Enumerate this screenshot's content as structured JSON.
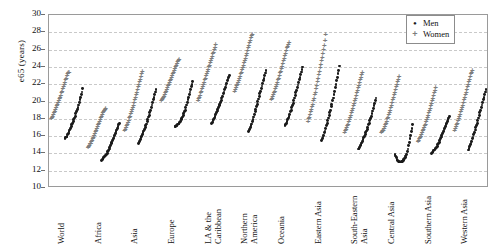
{
  "chart_data": {
    "type": "scatter",
    "title": "",
    "xlabel": "",
    "ylabel": "e65 (years)",
    "ylim": [
      10,
      30
    ],
    "yticks": [
      10,
      12,
      14,
      16,
      18,
      20,
      22,
      24,
      26,
      28,
      30
    ],
    "grid": true,
    "legend_position": "top-right",
    "colors": {
      "men": "#1a1a1a",
      "women": "#7d7d7d"
    },
    "categories": [
      "World",
      "Africa",
      "Asia",
      "Europe",
      "LA & the\nCaribbean",
      "Northern\nAmerica",
      "Oceania",
      "Eastern Asia",
      "South-Eastern\nAsia",
      "Central Asia",
      "Southern Asia",
      "Western Asia"
    ],
    "series": [
      {
        "name": "Men",
        "marker": "dot"
      },
      {
        "name": "Women",
        "marker": "plus"
      }
    ],
    "clusters": [
      {
        "category": "World",
        "men": [
          15.7,
          15.8,
          15.9,
          16.0,
          16.2,
          16.3,
          16.5,
          16.7,
          16.9,
          17.1,
          17.3,
          17.5,
          17.7,
          17.9,
          18.1,
          18.3,
          18.6,
          18.8,
          19.1,
          19.3,
          19.6,
          19.9,
          20.2,
          20.5,
          20.8,
          21.1,
          21.5
        ],
        "women": [
          17.8,
          17.9,
          18.1,
          18.3,
          18.5,
          18.7,
          18.9,
          19.1,
          19.3,
          19.5,
          19.7,
          19.9,
          20.1,
          20.3,
          20.5,
          20.8,
          21.0,
          21.3,
          21.5,
          21.8,
          22.0,
          22.3,
          22.5,
          22.8,
          23.0,
          23.1,
          23.2
        ]
      },
      {
        "category": "Africa",
        "men": [
          13.2,
          13.3,
          13.4,
          13.5,
          13.6,
          13.7,
          13.8,
          13.9,
          14.0,
          14.2,
          14.3,
          14.5,
          14.7,
          14.9,
          15.1,
          15.3,
          15.5,
          15.7,
          15.9,
          16.1,
          16.3,
          16.5,
          16.7,
          16.9,
          17.1,
          17.3,
          17.5
        ],
        "women": [
          14.5,
          14.6,
          14.7,
          14.9,
          15.0,
          15.2,
          15.3,
          15.5,
          15.7,
          15.9,
          16.1,
          16.3,
          16.5,
          16.7,
          16.9,
          17.1,
          17.3,
          17.5,
          17.7,
          17.9,
          18.1,
          18.3,
          18.5,
          18.7,
          18.8,
          18.9,
          19.0
        ]
      },
      {
        "category": "Asia",
        "men": [
          15.1,
          15.2,
          15.4,
          15.6,
          15.8,
          16.0,
          16.2,
          16.4,
          16.6,
          16.8,
          17.0,
          17.2,
          17.4,
          17.7,
          17.9,
          18.2,
          18.4,
          18.7,
          19.0,
          19.3,
          19.6,
          19.9,
          20.2,
          20.5,
          20.8,
          21.1,
          21.4
        ],
        "women": [
          16.4,
          16.6,
          16.8,
          17.0,
          17.2,
          17.4,
          17.6,
          17.9,
          18.1,
          18.4,
          18.6,
          18.9,
          19.1,
          19.4,
          19.7,
          20.0,
          20.3,
          20.6,
          20.9,
          21.2,
          21.5,
          21.8,
          22.1,
          22.4,
          22.7,
          23.0,
          23.3
        ]
      },
      {
        "category": "Europe",
        "men": [
          17.1,
          17.1,
          17.2,
          17.2,
          17.3,
          17.4,
          17.5,
          17.6,
          17.7,
          17.9,
          18.0,
          18.2,
          18.4,
          18.6,
          18.8,
          19.0,
          19.3,
          19.6,
          19.9,
          20.2,
          20.5,
          20.8,
          21.1,
          21.4,
          21.7,
          22.0,
          22.3
        ],
        "women": [
          19.9,
          20.0,
          20.1,
          20.3,
          20.4,
          20.6,
          20.8,
          21.0,
          21.2,
          21.4,
          21.6,
          21.8,
          22.0,
          22.2,
          22.4,
          22.6,
          22.8,
          23.0,
          23.2,
          23.4,
          23.6,
          23.8,
          24.0,
          24.2,
          24.4,
          24.6,
          24.7
        ]
      },
      {
        "category": "LA & the\nCaribbean",
        "men": [
          17.5,
          17.6,
          17.8,
          17.9,
          18.1,
          18.3,
          18.5,
          18.7,
          18.9,
          19.1,
          19.3,
          19.5,
          19.7,
          19.9,
          20.1,
          20.4,
          20.6,
          20.9,
          21.1,
          21.4,
          21.6,
          21.9,
          22.1,
          22.4,
          22.6,
          22.8,
          23.0
        ],
        "women": [
          19.9,
          20.1,
          20.3,
          20.5,
          20.8,
          21.0,
          21.3,
          21.5,
          21.8,
          22.0,
          22.3,
          22.5,
          22.8,
          23.0,
          23.3,
          23.5,
          23.8,
          24.0,
          24.3,
          24.5,
          24.8,
          25.0,
          25.3,
          25.5,
          25.8,
          26.1,
          26.4
        ]
      },
      {
        "category": "Northern\nAmerica",
        "men": [
          16.5,
          16.6,
          16.8,
          17.0,
          17.2,
          17.4,
          17.7,
          17.9,
          18.2,
          18.5,
          18.8,
          19.1,
          19.4,
          19.7,
          20.0,
          20.3,
          20.6,
          20.9,
          21.2,
          21.5,
          21.8,
          22.1,
          22.4,
          22.7,
          23.0,
          23.3,
          23.6
        ],
        "women": [
          21.0,
          21.2,
          21.4,
          21.6,
          21.8,
          22.0,
          22.2,
          22.5,
          22.7,
          23.0,
          23.2,
          23.5,
          23.7,
          24.0,
          24.3,
          24.5,
          24.8,
          25.1,
          25.4,
          25.7,
          26.0,
          26.3,
          26.6,
          26.9,
          27.2,
          27.4,
          27.6
        ]
      },
      {
        "category": "Oceania",
        "men": [
          17.2,
          17.3,
          17.5,
          17.7,
          17.9,
          18.1,
          18.3,
          18.5,
          18.8,
          19.0,
          19.3,
          19.5,
          19.8,
          20.1,
          20.4,
          20.7,
          21.0,
          21.3,
          21.6,
          21.9,
          22.2,
          22.5,
          22.8,
          23.1,
          23.4,
          23.7,
          24.0
        ],
        "women": [
          20.0,
          20.2,
          20.4,
          20.6,
          20.8,
          21.0,
          21.3,
          21.5,
          21.8,
          22.0,
          22.3,
          22.5,
          22.8,
          23.1,
          23.3,
          23.6,
          23.9,
          24.2,
          24.5,
          24.8,
          25.1,
          25.4,
          25.7,
          26.0,
          26.2,
          26.4,
          26.6
        ]
      },
      {
        "category": "Eastern Asia",
        "men": [
          15.5,
          15.7,
          15.9,
          16.1,
          16.4,
          16.6,
          16.9,
          17.2,
          17.5,
          17.8,
          18.1,
          18.4,
          18.7,
          19.0,
          19.4,
          19.7,
          20.1,
          20.4,
          20.8,
          21.2,
          21.6,
          22.0,
          22.4,
          22.8,
          23.2,
          23.6,
          24.1
        ],
        "women": [
          17.5,
          17.8,
          18.0,
          18.3,
          18.6,
          18.9,
          19.2,
          19.5,
          19.9,
          20.2,
          20.6,
          20.9,
          21.3,
          21.7,
          22.1,
          22.5,
          22.9,
          23.3,
          23.7,
          24.1,
          24.5,
          24.9,
          25.4,
          25.8,
          26.3,
          26.9,
          27.5
        ]
      },
      {
        "category": "South-Eastern\nAsia",
        "men": [
          14.5,
          14.6,
          14.7,
          14.9,
          15.0,
          15.2,
          15.4,
          15.6,
          15.8,
          16.0,
          16.2,
          16.4,
          16.6,
          16.8,
          17.0,
          17.3,
          17.5,
          17.8,
          18.0,
          18.3,
          18.6,
          18.9,
          19.2,
          19.5,
          19.8,
          20.1,
          20.4
        ],
        "women": [
          16.2,
          16.4,
          16.6,
          16.8,
          17.0,
          17.2,
          17.5,
          17.7,
          18.0,
          18.2,
          18.5,
          18.8,
          19.0,
          19.3,
          19.6,
          19.9,
          20.2,
          20.5,
          20.8,
          21.1,
          21.4,
          21.7,
          22.0,
          22.3,
          22.6,
          22.9,
          23.2
        ]
      },
      {
        "category": "Central Asia",
        "men": [
          13.9,
          13.7,
          13.5,
          13.3,
          13.2,
          13.1,
          13.1,
          13.0,
          13.0,
          13.0,
          13.1,
          13.1,
          13.2,
          13.3,
          13.4,
          13.5,
          13.7,
          13.9,
          14.2,
          14.5,
          14.9,
          15.3,
          15.7,
          16.1,
          16.5,
          16.9,
          17.3
        ],
        "women": [
          16.2,
          16.3,
          16.4,
          16.5,
          16.7,
          16.9,
          17.1,
          17.3,
          17.5,
          17.8,
          18.0,
          18.3,
          18.5,
          18.8,
          19.1,
          19.4,
          19.7,
          20.0,
          20.3,
          20.6,
          20.9,
          21.2,
          21.5,
          21.8,
          22.1,
          22.4,
          22.7
        ]
      },
      {
        "category": "Southern Asia",
        "men": [
          14.0,
          14.1,
          14.2,
          14.3,
          14.4,
          14.5,
          14.6,
          14.7,
          14.8,
          15.0,
          15.1,
          15.3,
          15.5,
          15.7,
          15.9,
          16.1,
          16.3,
          16.5,
          16.7,
          16.9,
          17.1,
          17.3,
          17.5,
          17.7,
          17.9,
          18.1,
          18.3
        ],
        "women": [
          15.2,
          15.3,
          15.5,
          15.6,
          15.8,
          16.0,
          16.2,
          16.4,
          16.6,
          16.8,
          17.0,
          17.2,
          17.5,
          17.7,
          18.0,
          18.2,
          18.5,
          18.8,
          19.0,
          19.3,
          19.6,
          19.9,
          20.2,
          20.5,
          20.8,
          21.1,
          21.4
        ]
      },
      {
        "category": "Western Asia",
        "men": [
          14.4,
          14.6,
          14.8,
          15.0,
          15.2,
          15.4,
          15.7,
          15.9,
          16.2,
          16.4,
          16.7,
          17.0,
          17.2,
          17.5,
          17.8,
          18.1,
          18.4,
          18.7,
          19.0,
          19.3,
          19.6,
          19.9,
          20.2,
          20.5,
          20.8,
          21.1,
          21.4
        ],
        "women": [
          16.5,
          16.7,
          16.9,
          17.1,
          17.3,
          17.6,
          17.8,
          18.1,
          18.3,
          18.6,
          18.9,
          19.1,
          19.4,
          19.7,
          20.0,
          20.3,
          20.6,
          20.9,
          21.2,
          21.5,
          21.8,
          22.1,
          22.4,
          22.7,
          23.0,
          23.2,
          23.4
        ]
      }
    ],
    "legend": [
      {
        "label": "Men",
        "marker": "•"
      },
      {
        "label": "Women",
        "marker": "+"
      }
    ]
  }
}
